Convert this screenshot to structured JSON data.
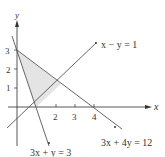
{
  "diagram": {
    "type": "linear-inequality-feasible-region",
    "axes": {
      "x_label": "x",
      "y_label": "y",
      "x_ticks": [
        "2",
        "3",
        "4"
      ],
      "y_ticks": [
        "1",
        "2",
        "3"
      ]
    },
    "lines": [
      {
        "id": "line1",
        "equation": "x − y = 1"
      },
      {
        "id": "line2",
        "equation": "3x + y = 3"
      },
      {
        "id": "line3",
        "equation": "3x + 4y = 12"
      }
    ],
    "region": {
      "vertices": [
        [
          0,
          3
        ],
        [
          1,
          0
        ],
        [
          2.29,
          1.29
        ]
      ],
      "fill": "#e6e6e6"
    },
    "colors": {
      "line": "#555555",
      "axis": "#444444",
      "region": "#e6e6e6"
    }
  }
}
